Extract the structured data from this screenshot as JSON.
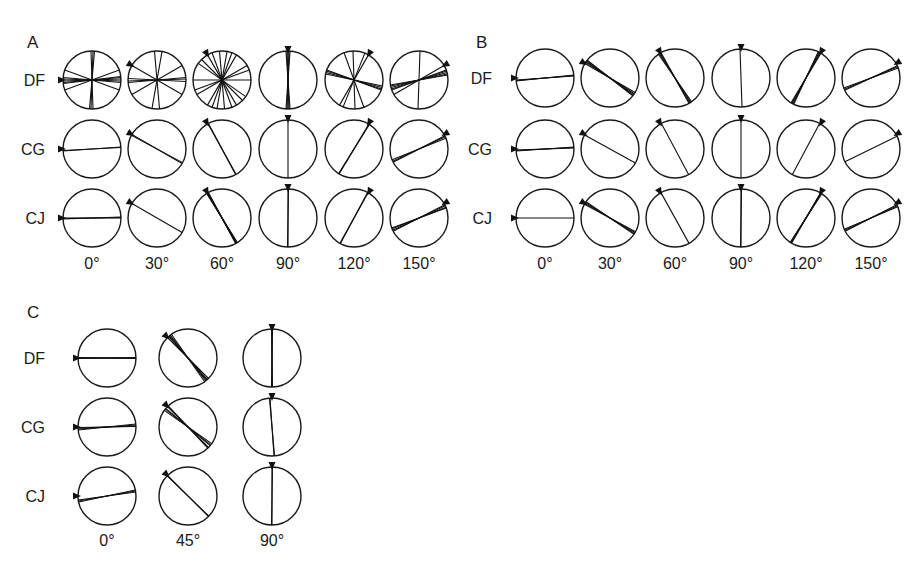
{
  "figure": {
    "panels": [
      {
        "id": "A",
        "letter": "A",
        "letter_pos": [
          27,
          48
        ],
        "row_labels": [
          "DF",
          "CG",
          "CJ"
        ],
        "row_label_x": 45,
        "col_labels": [
          "0°",
          "30°",
          "60°",
          "90°",
          "120°",
          "150°"
        ],
        "col_x": [
          92,
          157,
          222,
          288,
          354,
          419
        ],
        "row_y": [
          80,
          149,
          218
        ],
        "col_label_y": 269,
        "radius": 29,
        "stimulus_angles": [
          0,
          30,
          60,
          90,
          120,
          150
        ],
        "cells": [
          [
            {
              "lines": [
                178,
                182,
                175,
                185,
                20,
                160,
                95,
                88,
                92,
                173
              ],
              "thick": [
                0,
                1
              ]
            },
            {
              "lines": [
                30,
                150,
                175,
                183,
                100,
                85,
                178
              ],
              "thick": []
            },
            {
              "lines": [
                60,
                120,
                100,
                85,
                70,
                45,
                150,
                0,
                110,
                35,
                160
              ],
              "thick": []
            },
            {
              "lines": [
                90,
                92,
                88,
                94,
                86
              ],
              "thick": [
                0
              ]
            },
            {
              "lines": [
                120,
                15,
                18,
                12,
                70,
                20,
                112,
                88
              ],
              "thick": [
                1
              ]
            },
            {
              "lines": [
                150,
                165,
                168,
                162,
                170,
                92,
                160
              ],
              "thick": [
                1
              ]
            }
          ],
          [
            {
              "lines": [
                176,
                177
              ],
              "thick": [
                0
              ]
            },
            {
              "lines": [
                28,
                30
              ],
              "thick": [
                0
              ]
            },
            {
              "lines": [
                61,
                62
              ],
              "thick": [
                0
              ]
            },
            {
              "lines": [
                90
              ],
              "thick": []
            },
            {
              "lines": [
                121,
                122
              ],
              "thick": [
                0
              ]
            },
            {
              "lines": [
                155,
                158,
                153
              ],
              "thick": [
                0
              ]
            }
          ],
          [
            {
              "lines": [
                179,
                178,
                180
              ],
              "thick": [
                0
              ]
            },
            {
              "lines": [
                30
              ],
              "thick": []
            },
            {
              "lines": [
                58,
                59,
                60,
                61,
                62
              ],
              "thick": [
                0,
                1,
                2
              ]
            },
            {
              "lines": [
                90,
                91
              ],
              "thick": [
                0
              ]
            },
            {
              "lines": [
                118,
                119
              ],
              "thick": [
                0
              ]
            },
            {
              "lines": [
                155,
                158,
                153,
                160
              ],
              "thick": [
                0
              ]
            }
          ]
        ]
      },
      {
        "id": "B",
        "letter": "B",
        "letter_pos": [
          476,
          48
        ],
        "row_labels": [
          "DF",
          "CG",
          "CJ"
        ],
        "row_label_x": 492,
        "col_labels": [
          "0°",
          "30°",
          "60°",
          "90°",
          "120°",
          "150°"
        ],
        "col_x": [
          545,
          610,
          675,
          741,
          806,
          871
        ],
        "row_y": [
          78,
          149,
          218
        ],
        "col_label_y": 269,
        "radius": 29,
        "stimulus_angles": [
          0,
          30,
          60,
          90,
          120,
          150
        ],
        "cells": [
          [
            {
              "lines": [
                175,
                176,
                174
              ],
              "thick": [
                0
              ]
            },
            {
              "lines": [
                33,
                35,
                37,
                30,
                38
              ],
              "thick": [
                0
              ]
            },
            {
              "lines": [
                57,
                59,
                61,
                55
              ],
              "thick": [
                0
              ]
            },
            {
              "lines": [
                88
              ],
              "thick": []
            },
            {
              "lines": [
                117,
                119,
                115,
                121
              ],
              "thick": [
                0
              ]
            },
            {
              "lines": [
                155,
                157,
                160
              ],
              "thick": [
                0
              ]
            }
          ],
          [
            {
              "lines": [
                178,
                177,
                176
              ],
              "thick": [
                0,
                1
              ]
            },
            {
              "lines": [
                29
              ],
              "thick": [
                0
              ]
            },
            {
              "lines": [
                62
              ],
              "thick": []
            },
            {
              "lines": [
                90
              ],
              "thick": []
            },
            {
              "lines": [
                118
              ],
              "thick": []
            },
            {
              "lines": [
                154
              ],
              "thick": []
            }
          ],
          [
            {
              "lines": [
                180
              ],
              "thick": []
            },
            {
              "lines": [
                30,
                32,
                34,
                28
              ],
              "thick": [
                0,
                1
              ]
            },
            {
              "lines": [
                61
              ],
              "thick": [
                0
              ]
            },
            {
              "lines": [
                90,
                91
              ],
              "thick": []
            },
            {
              "lines": [
                121,
                122,
                120,
                123
              ],
              "thick": [
                0,
                1
              ]
            },
            {
              "lines": [
                155,
                157,
                153
              ],
              "thick": [
                0
              ]
            }
          ]
        ]
      },
      {
        "id": "C",
        "letter": "C",
        "letter_pos": [
          27,
          318
        ],
        "row_labels": [
          "DF",
          "CG",
          "CJ"
        ],
        "row_label_x": 45,
        "col_labels": [
          "0°",
          "45°",
          "90°"
        ],
        "col_x": [
          107,
          188,
          272
        ],
        "row_y": [
          358,
          427,
          496
        ],
        "col_label_y": 546,
        "radius": 29,
        "stimulus_angles": [
          0,
          45,
          90
        ],
        "cells": [
          [
            {
              "lines": [
                180,
                179,
                181,
                180.5
              ],
              "thick": [
                0,
                1
              ]
            },
            {
              "lines": [
                45,
                48,
                52,
                50,
                55
              ],
              "thick": [
                0,
                1,
                2
              ]
            },
            {
              "lines": [
                90,
                91,
                89
              ],
              "thick": [
                0
              ]
            }
          ],
          [
            {
              "lines": [
                178,
                176,
                174,
                179
              ],
              "thick": [
                0,
                1
              ]
            },
            {
              "lines": [
                35,
                40,
                45,
                38,
                47
              ],
              "thick": [
                0,
                1
              ]
            },
            {
              "lines": [
                85,
                86
              ],
              "thick": [
                0
              ]
            }
          ],
          [
            {
              "lines": [
                170,
                172,
                168
              ],
              "thick": [
                0,
                1,
                2
              ]
            },
            {
              "lines": [
                44,
                45
              ],
              "thick": [
                0,
                1
              ]
            },
            {
              "lines": [
                90,
                91
              ],
              "thick": [
                0,
                1
              ]
            }
          ]
        ]
      }
    ]
  },
  "chart_data": {
    "type": "polar-orientation-grid",
    "title": "",
    "panels": [
      {
        "panel": "A",
        "subjects": [
          "DF",
          "CG",
          "CJ"
        ],
        "conditions_deg": [
          0,
          30,
          60,
          90,
          120,
          150
        ]
      },
      {
        "panel": "B",
        "subjects": [
          "DF",
          "CG",
          "CJ"
        ],
        "conditions_deg": [
          0,
          30,
          60,
          90,
          120,
          150
        ]
      },
      {
        "panel": "C",
        "subjects": [
          "DF",
          "CG",
          "CJ"
        ],
        "conditions_deg": [
          0,
          45,
          90
        ]
      }
    ]
  }
}
